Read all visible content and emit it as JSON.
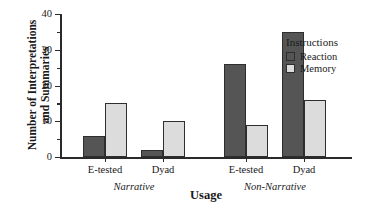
{
  "chart_data": {
    "type": "bar",
    "title": "",
    "xlabel": "Usage",
    "ylabel_line1": "Number of Interpretations",
    "ylabel_line2": "and Summaries",
    "ylim": [
      0,
      40
    ],
    "ytick_values": [
      0,
      10,
      20,
      30,
      40
    ],
    "ytick_labels": [
      "0",
      "10",
      "20",
      "30",
      "40"
    ],
    "yminor_values": [
      5,
      15,
      25,
      35
    ],
    "grid": false,
    "legend_position": "right",
    "legend_title": "Instructions",
    "categories": [
      "E-tested",
      "Dyad",
      "E-tested",
      "Dyad"
    ],
    "groups": [
      {
        "label": "Narrative",
        "categories": [
          "E-tested",
          "Dyad"
        ]
      },
      {
        "label": "Non-Narrative",
        "categories": [
          "E-tested",
          "Dyad"
        ]
      }
    ],
    "series": [
      {
        "name": "Reaction",
        "color": "#555555",
        "values": [
          6,
          2,
          26,
          35
        ]
      },
      {
        "name": "Memory",
        "color": "#dcdcdc",
        "values": [
          15,
          10,
          9,
          16
        ]
      }
    ]
  },
  "colors": {
    "reaction": "#555555",
    "memory": "#dcdcdc",
    "axis": "#2a2a2a",
    "bar_edge": "#2e2e2e",
    "background": "#ffffff"
  }
}
